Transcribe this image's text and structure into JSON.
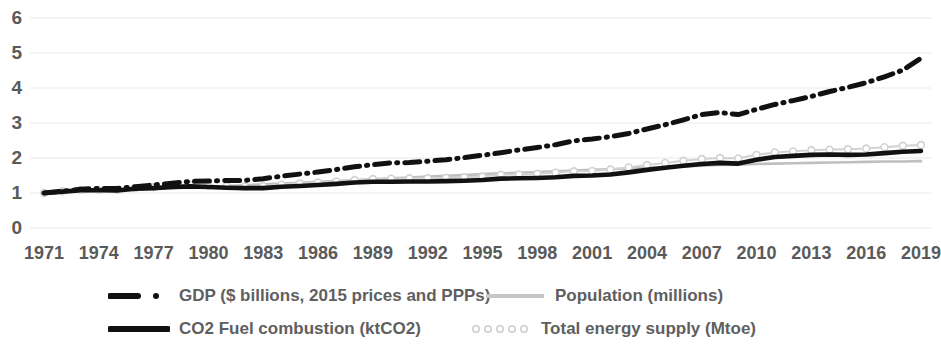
{
  "chart_data": {
    "type": "line",
    "title": "",
    "subtitle": "",
    "xlabel": "",
    "ylabel": "",
    "xlim": [
      1971,
      2019
    ],
    "ylim": [
      0,
      6
    ],
    "y_ticks": [
      "0",
      "1",
      "2",
      "3",
      "4",
      "5",
      "6"
    ],
    "x_ticks": [
      "1971",
      "1974",
      "1977",
      "1980",
      "1983",
      "1986",
      "1989",
      "1992",
      "1995",
      "1998",
      "2001",
      "2004",
      "2007",
      "2010",
      "2013",
      "2016",
      "2019"
    ],
    "grid": true,
    "grid_color": "#e8e8e8",
    "legend_position": "bottom",
    "x": [
      1971,
      1972,
      1973,
      1974,
      1975,
      1976,
      1977,
      1978,
      1979,
      1980,
      1981,
      1982,
      1983,
      1984,
      1985,
      1986,
      1987,
      1988,
      1989,
      1990,
      1991,
      1992,
      1993,
      1994,
      1995,
      1996,
      1997,
      1998,
      1999,
      2000,
      2001,
      2002,
      2003,
      2004,
      2005,
      2006,
      2007,
      2008,
      2009,
      2010,
      2011,
      2012,
      2013,
      2014,
      2015,
      2016,
      2017,
      2018,
      2019
    ],
    "series": [
      {
        "name": "GDP ($ billions, 2015 prices and PPPs)",
        "style": "dash-dot",
        "color": "#111111",
        "values": [
          1.0,
          1.05,
          1.11,
          1.13,
          1.13,
          1.18,
          1.23,
          1.28,
          1.33,
          1.34,
          1.36,
          1.36,
          1.41,
          1.48,
          1.54,
          1.6,
          1.67,
          1.75,
          1.81,
          1.86,
          1.87,
          1.91,
          1.95,
          2.01,
          2.08,
          2.15,
          2.23,
          2.3,
          2.38,
          2.49,
          2.54,
          2.61,
          2.7,
          2.83,
          2.95,
          3.09,
          3.24,
          3.3,
          3.24,
          3.39,
          3.53,
          3.64,
          3.76,
          3.9,
          4.02,
          4.15,
          4.32,
          4.51,
          4.85
        ]
      },
      {
        "name": "Population (millions)",
        "style": "solid-thin",
        "color": "#bfbfbf",
        "values": [
          1.0,
          1.02,
          1.04,
          1.06,
          1.08,
          1.1,
          1.12,
          1.14,
          1.16,
          1.18,
          1.2,
          1.22,
          1.25,
          1.27,
          1.29,
          1.32,
          1.34,
          1.37,
          1.39,
          1.42,
          1.44,
          1.47,
          1.49,
          1.51,
          1.54,
          1.56,
          1.58,
          1.6,
          1.62,
          1.64,
          1.66,
          1.68,
          1.7,
          1.72,
          1.74,
          1.76,
          1.78,
          1.8,
          1.81,
          1.83,
          1.84,
          1.85,
          1.86,
          1.87,
          1.88,
          1.89,
          1.9,
          1.9,
          1.91
        ]
      },
      {
        "name": "CO2 Fuel combustion (ktCO2)",
        "style": "solid-thick",
        "color": "#111111",
        "values": [
          1.0,
          1.04,
          1.08,
          1.08,
          1.07,
          1.12,
          1.14,
          1.17,
          1.19,
          1.17,
          1.15,
          1.14,
          1.14,
          1.18,
          1.2,
          1.23,
          1.26,
          1.3,
          1.32,
          1.32,
          1.33,
          1.33,
          1.34,
          1.35,
          1.37,
          1.41,
          1.42,
          1.43,
          1.45,
          1.49,
          1.5,
          1.53,
          1.59,
          1.66,
          1.72,
          1.78,
          1.83,
          1.86,
          1.84,
          1.95,
          2.03,
          2.06,
          2.09,
          2.1,
          2.09,
          2.1,
          2.14,
          2.18,
          2.2
        ]
      },
      {
        "name": "Total energy supply (Mtoe)",
        "style": "dotted-markers",
        "color": "#d2d2d2",
        "values": [
          1.0,
          1.05,
          1.09,
          1.09,
          1.09,
          1.14,
          1.17,
          1.2,
          1.23,
          1.21,
          1.2,
          1.19,
          1.2,
          1.24,
          1.27,
          1.3,
          1.33,
          1.37,
          1.4,
          1.41,
          1.42,
          1.42,
          1.43,
          1.45,
          1.47,
          1.52,
          1.53,
          1.55,
          1.58,
          1.62,
          1.63,
          1.67,
          1.73,
          1.8,
          1.86,
          1.92,
          1.97,
          2.0,
          1.99,
          2.09,
          2.16,
          2.19,
          2.22,
          2.24,
          2.25,
          2.27,
          2.31,
          2.35,
          2.37
        ]
      }
    ]
  },
  "legend": {
    "items": [
      {
        "label": "GDP ($ billions, 2015 prices and PPPs)",
        "swatch": "dash-dot-swatch"
      },
      {
        "label": "Population (millions)",
        "swatch": "solid-thin-swatch"
      },
      {
        "label": "CO2 Fuel combustion (ktCO2)",
        "swatch": "solid-thick-swatch"
      },
      {
        "label": "Total energy supply (Mtoe)",
        "swatch": "dotted-markers-swatch"
      }
    ]
  }
}
